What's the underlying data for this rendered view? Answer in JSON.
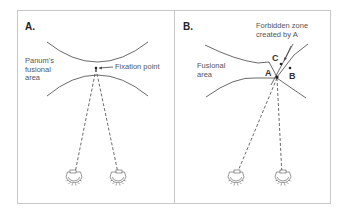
{
  "figure": {
    "panels": [
      {
        "id": "A",
        "label": "A.",
        "region_label": "Panum's\nfusional\narea",
        "annotation": "Fixation point"
      },
      {
        "id": "B",
        "label": "B.",
        "region_label": "Fusional\narea",
        "annotation": "Forbidden zone\ncreated by A",
        "points": [
          {
            "name": "A"
          },
          {
            "name": "B"
          },
          {
            "name": "C"
          }
        ]
      }
    ],
    "colors": {
      "line": "#444444",
      "frame": "#c8c8c8",
      "background": "#ffffff"
    }
  }
}
